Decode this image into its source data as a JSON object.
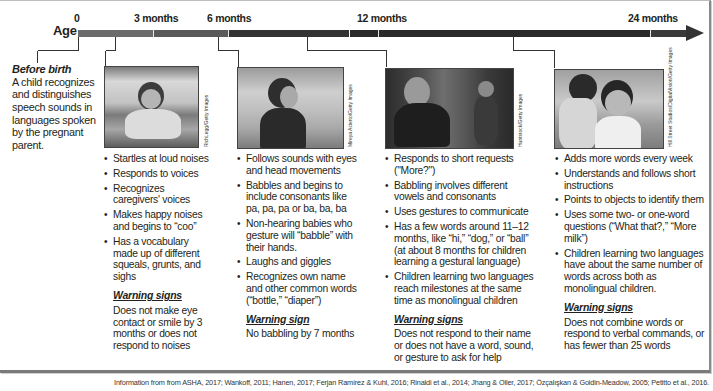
{
  "timeline": {
    "axis_label": "Age",
    "ticks": [
      {
        "label": "0",
        "x": 78
      },
      {
        "label": "3 months",
        "x": 153
      },
      {
        "label": "6 months",
        "x": 228
      },
      {
        "label": "12 months",
        "x": 378
      },
      {
        "label": "24 months",
        "x": 650
      }
    ],
    "colors": {
      "early": "#6b6b6b",
      "late": "#2a2a2a"
    }
  },
  "before_birth": {
    "title": "Before birth",
    "text": "A child recognizes and distinguishes speech sounds in languages spoken by the pregnant parent."
  },
  "columns": [
    {
      "photo_credit": "RichLegg/Getty Images",
      "photo_alt": "Baby laughing while crawling on floor",
      "items": [
        "Startles at loud noises",
        "Responds to voices",
        "Recognizes caregivers' voices",
        "Makes happy noises and begins to “coo”",
        "Has a vocabulary made up of different squeals, grunts, and sighs"
      ],
      "warning_title": "Warning signs",
      "warning_text": "Does not make eye contact or smile by 3 months or does not respond to noises"
    },
    {
      "photo_credit": "Mireya Acierto/Getty Images",
      "photo_alt": "Baby sitting and gesturing",
      "items": [
        "Follows sounds with eyes and head movements",
        "Babbles and begins to include consonants like pa, pa, pa or ba, ba, ba",
        "Non-hearing babies who gesture will “babble” with their hands.",
        "Laughs and giggles",
        "Recognizes own name and other common words (“bottle,” “diaper”)"
      ],
      "warning_title": "Warning sign",
      "warning_text": "No babbling by 7 months"
    },
    {
      "photo_credit": "Huntstock/Getty Images",
      "photo_alt": "Adult kneeling and gesturing to a toddler outdoors",
      "items": [
        "Responds to short requests (\"More?\")",
        "Babbling involves different vowels and consonants",
        "Uses gestures to communicate",
        "Has a few words around 11–12 months, like “hi,” “dog,” or “ball” (at about 8 months for children learning a gestural language)",
        "Children learning two languages reach milestones at the same time as monolingual children"
      ],
      "warning_title": "Warning signs",
      "warning_text": "Does not respond to their name or does not have a word, sound, or gesture to ask for help"
    },
    {
      "photo_credit": "Hill Street Studios/DigitalVision/Getty Images",
      "photo_alt": "Child whispering into another child's ear",
      "items": [
        "Adds more words every week",
        "Understands and follows short instructions",
        "Points to objects to identify them",
        "Uses some two- or one-word questions (“What that?,” “More milk”)",
        "Children learning two languages have about the same number of words across both as monolingual children."
      ],
      "warning_title": "Warning signs",
      "warning_text": "Does not combine words or respond to verbal commands, or has fewer than 25 words"
    }
  ],
  "footer": {
    "source": "Information from from ASHA, 2017; Wankoff, 2011; Hanen, 2017; Ferjan Ramírez & Kuhl, 2016; Rinaldi et al., 2014; Jhang & Oller, 2017; Özçalışkan & Goldin-Meadow, 2005; Petitto et al., 2016."
  }
}
